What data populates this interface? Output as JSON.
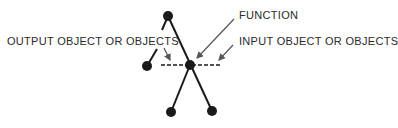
{
  "diagram": {
    "labels": {
      "function": "FUNCTION",
      "input": "INPUT OBJECT OR OBJECTS",
      "output": "OUTPUT OBJECT OR OBJECTS"
    },
    "colors": {
      "ink": "#1a1a1a",
      "arrow": "#555555",
      "text": "#2a2a2a"
    },
    "nodes": [
      {
        "id": "top",
        "x": 168,
        "y": 16
      },
      {
        "id": "center",
        "x": 190,
        "y": 65
      },
      {
        "id": "left",
        "x": 147,
        "y": 66
      },
      {
        "id": "bottom-left",
        "x": 171,
        "y": 112
      },
      {
        "id": "bottom-right",
        "x": 212,
        "y": 111
      }
    ]
  }
}
